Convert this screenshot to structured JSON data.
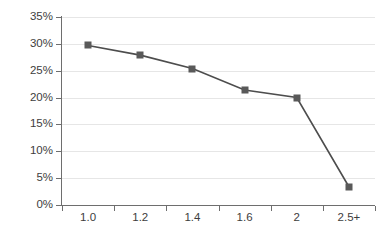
{
  "chart_data": {
    "type": "line",
    "title": "",
    "subtitle": "",
    "xlabel": "",
    "ylabel": "",
    "categories": [
      "1.0",
      "1.2",
      "1.4",
      "1.6",
      "2",
      "2.5+"
    ],
    "values": [
      29.7,
      27.9,
      25.4,
      21.4,
      20.0,
      3.4
    ],
    "value_labels": [
      "29.7%",
      "27.9%",
      "25.4%",
      "21.4%",
      "20.0%",
      "3.4%"
    ],
    "ylim": [
      0,
      35
    ],
    "y_ticks": [
      0,
      5,
      10,
      15,
      20,
      25,
      30,
      35
    ],
    "y_tick_labels": [
      "0%",
      "5%",
      "10%",
      "15%",
      "20%",
      "25%",
      "30%",
      "35%"
    ],
    "grid": true,
    "grid_axis": "y",
    "legend": false,
    "legend_position": "none",
    "series": [
      {
        "name": "",
        "values": [
          29.7,
          27.9,
          25.4,
          21.4,
          20.0,
          3.4
        ],
        "marker": "square",
        "marker_color": "#595959",
        "line_color": "#4d4d4d"
      }
    ],
    "colors": {
      "line": "#4d4d4d",
      "marker": "#595959",
      "grid": "#e6e6e6",
      "axis": "#6e6e6e",
      "tick_label": "#3d3d3d",
      "background": "#ffffff"
    }
  }
}
